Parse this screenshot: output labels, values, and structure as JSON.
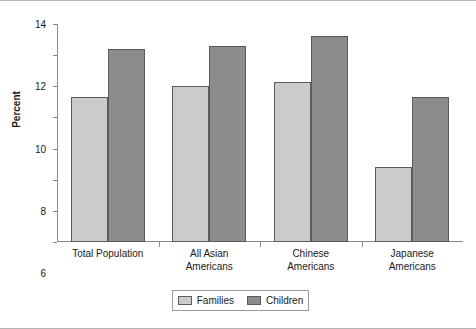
{
  "chart_data": {
    "type": "bar",
    "title": "",
    "xlabel": "",
    "ylabel": "Percent",
    "ylim": [
      0,
      14
    ],
    "yticks": [
      0,
      2,
      4,
      6,
      8,
      10,
      12,
      14
    ],
    "grid": false,
    "legend_position": "bottom-center",
    "categories": [
      "Total Population",
      "All Asian Americans",
      "Chinese Americans",
      "Japanese Americans"
    ],
    "category_lines": [
      [
        "Total Population"
      ],
      [
        "All Asian",
        "Americans"
      ],
      [
        "Chinese",
        "Americans"
      ],
      [
        "Japanese",
        "Americans"
      ]
    ],
    "series": [
      {
        "name": "Families",
        "color": "#cbcbcb",
        "values": [
          9.3,
          10.0,
          10.3,
          4.8
        ]
      },
      {
        "name": "Children",
        "color": "#8c8c8c",
        "values": [
          12.4,
          12.6,
          13.2,
          9.3
        ]
      }
    ]
  },
  "legend": {
    "items": [
      {
        "label": "Families",
        "swatch": "families"
      },
      {
        "label": "Children",
        "swatch": "children"
      }
    ]
  }
}
